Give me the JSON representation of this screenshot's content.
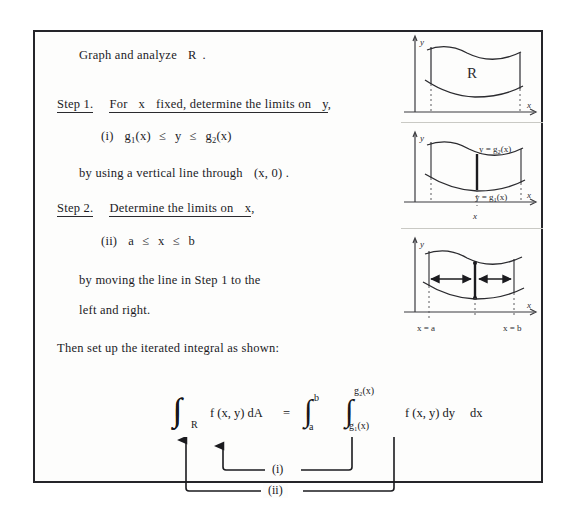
{
  "document": {
    "lines": {
      "intro": "Graph and analyze",
      "intro_region": "R",
      "intro_period": ".",
      "step1_label": "Step 1.",
      "step1_text_a": "For",
      "step1_text_b": "x",
      "step1_text_c": "fixed, determine the limits on",
      "step1_text_d": "y",
      "step1_comma": ",",
      "item_i_tag": "(i)",
      "item_i_g1": "g",
      "item_i_g1_sub": "1",
      "item_i_g1_arg": "(x)",
      "item_i_y": "y",
      "item_i_g2": "g",
      "item_i_g2_sub": "2",
      "item_i_g2_arg": "(x)",
      "by_vertical_a": "by using a vertical line through",
      "by_vertical_b": "(x, 0) .",
      "step2_label": "Step 2.",
      "step2_text_a": "Determine the limits on",
      "step2_text_b": "x",
      "step2_comma": ",",
      "item_ii_tag": "(ii)",
      "item_ii_a": "a",
      "item_ii_x": "x",
      "item_ii_b": "b",
      "by_moving": "by moving the line in  Step 1  to the",
      "left_right": "left and right.",
      "then_set_up": "Then set up the iterated integral as shown:"
    },
    "formula": {
      "double_integral": "∫∫",
      "sub_R": "R",
      "integrand_left": "f (x, y) dA",
      "equals": "=",
      "int_outer": "∫",
      "int_outer_upper": "b",
      "int_outer_lower": "a",
      "int_inner": "∫",
      "int_inner_upper": "g₂(x)",
      "int_inner_lower": "g₁(x)",
      "integrand_right": "f (x, y) dy",
      "dx": "dx"
    },
    "arrow_map": {
      "label_i": "(i)",
      "label_ii": "(ii)"
    }
  },
  "figures": [
    {
      "name": "region-R",
      "axis_y_label": "y",
      "axis_x_label": "x",
      "region_label": "R"
    },
    {
      "name": "vertical-line-limits",
      "axis_y_label": "y",
      "axis_x_label": "x",
      "upper_curve_label": "y = g₂(x)",
      "lower_curve_label": "y = g₁(x)",
      "tick_label": "x"
    },
    {
      "name": "sweep-limits",
      "axis_y_label": "y",
      "axis_x_label": "x",
      "left_bound_label": "x = a",
      "right_bound_label": "x = b"
    }
  ],
  "colors": {
    "ink": "#1b1b1f",
    "frame": "#25252a",
    "paper": "#fdfdfc",
    "page": "#ffffff",
    "pencil": "#3a3a3e"
  }
}
